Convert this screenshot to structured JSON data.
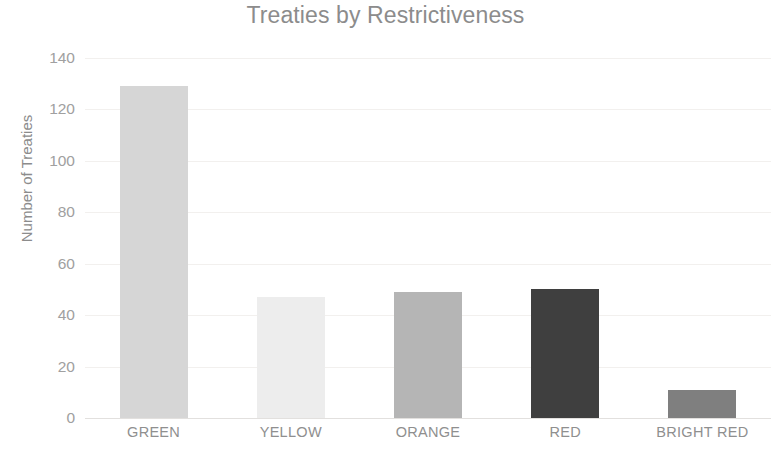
{
  "chart_data": {
    "type": "bar",
    "title": "Treaties by Restrictiveness",
    "xlabel": "",
    "ylabel": "Number of Treaties",
    "categories": [
      "GREEN",
      "YELLOW",
      "ORANGE",
      "RED",
      "BRIGHT RED"
    ],
    "values": [
      129,
      47,
      49,
      50,
      11
    ],
    "series": [
      {
        "name": "Number of Treaties",
        "values": [
          129,
          47,
          49,
          50,
          11
        ]
      }
    ],
    "bar_colors": [
      "#d6d6d6",
      "#ededed",
      "#b5b5b5",
      "#3f3f3f",
      "#7f7f7f"
    ],
    "ylim": [
      0,
      140
    ],
    "y_ticks": [
      0,
      20,
      40,
      60,
      80,
      100,
      120,
      140
    ],
    "y_tick_labels": [
      "0",
      "20",
      "40",
      "60",
      "80",
      "100",
      "120",
      "140"
    ],
    "grid": true,
    "grid_axis": "y",
    "gridline_color": "#f2f0ee",
    "legend": false,
    "legend_position": "none",
    "title_color": "#8c8c8c",
    "tick_label_color": "#a0a0a0",
    "axis_label_color": "#8c8c8c",
    "background_color": "#ffffff"
  }
}
